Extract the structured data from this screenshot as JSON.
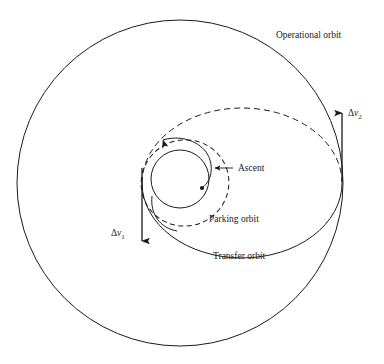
{
  "figure": {
    "type": "orbital-mechanics-schematic",
    "background_color": "#ffffff",
    "line_color": "#1a1a1a"
  },
  "labels": {
    "operational_orbit": "Operational orbit",
    "transfer_orbit": "Transfer orbit",
    "parking_orbit": "Parking orbit",
    "ascent": "Ascent",
    "delta_v1_symbol": "Δ",
    "delta_v1_var": "v",
    "delta_v1_sub": "1",
    "delta_v2_symbol": "Δ",
    "delta_v2_var": "v",
    "delta_v2_sub": "2"
  },
  "geometry": {
    "operational_orbit": {
      "shape": "circle",
      "center_x": 180,
      "center_y": 183,
      "radius": 163,
      "style": "solid"
    },
    "earth": {
      "shape": "circle",
      "center_x": 180,
      "center_y": 179,
      "radius": 29,
      "style": "solid"
    },
    "parking_orbit": {
      "shape": "ellipse",
      "center_x": 185,
      "center_y": 183,
      "radius_x": 43,
      "radius_y": 43,
      "rotation_deg": -20,
      "style": "dashed"
    },
    "transfer_orbit": {
      "shape": "ellipse",
      "center_x": 242,
      "center_y": 183,
      "radius_x": 100,
      "radius_y": 75,
      "upper_half_style": "dashed",
      "lower_half_style": "solid",
      "perigee_x": 142,
      "perigee_y": 183,
      "apogee_x": 342,
      "apogee_y": 183
    },
    "delta_v1_arrow": {
      "x": 142,
      "y_start": 168,
      "y_end": 243,
      "direction": "down"
    },
    "delta_v2_arrow": {
      "x": 342,
      "y_start": 180,
      "y_end": 112,
      "direction": "up"
    }
  },
  "annotations": [
    {
      "name": "operational-orbit",
      "text": "Operational orbit",
      "x": 276,
      "y": 38
    },
    {
      "name": "ascent",
      "text": "Ascent",
      "x": 236,
      "y": 171
    },
    {
      "name": "parking-orbit",
      "text": "Parking orbit",
      "x": 209,
      "y": 222
    },
    {
      "name": "transfer-orbit",
      "text": "Transfer orbit",
      "x": 213,
      "y": 259
    }
  ]
}
